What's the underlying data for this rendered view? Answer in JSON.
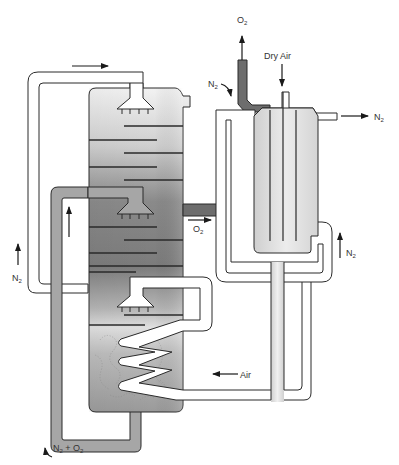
{
  "diagram": {
    "type": "process-flow",
    "labels": {
      "o2_top": "O",
      "o2_top_sub": "2",
      "dry_air": "Dry Air",
      "n2_left_of_exchanger": "N",
      "n2_left_of_exchanger_sub": "2",
      "n2_out_right": "N",
      "n2_out_right_sub": "2",
      "o2_side": "O",
      "o2_side_sub": "2",
      "n2_right_up": "N",
      "n2_right_up_sub": "2",
      "n2_left": "N",
      "n2_left_sub": "2",
      "air_in": "Air",
      "n2_o2_bottom_a": "N",
      "n2_o2_bottom_a_sub": "2",
      "n2_o2_bottom_plus": " + O",
      "n2_o2_bottom_b_sub": "2"
    },
    "components": [
      {
        "name": "distillation-column",
        "trays": 10,
        "spray_nozzles": 3
      },
      {
        "name": "reboiler-coil",
        "turns": 3
      },
      {
        "name": "heat-exchanger",
        "tubes": 4
      },
      {
        "name": "n2-recycle-loop"
      },
      {
        "name": "n2-o2-return-loop"
      },
      {
        "name": "o2-product-line"
      },
      {
        "name": "air-feed-line"
      }
    ],
    "colors": {
      "outline": "#2a2a2a",
      "column_dark": "#7a7a7a",
      "column_light": "#e8e8e8",
      "pipe_gray": "#a9a9a9",
      "o2_pipe": "#6d6d6d",
      "exchanger_fill": "#dcdcdc"
    }
  }
}
